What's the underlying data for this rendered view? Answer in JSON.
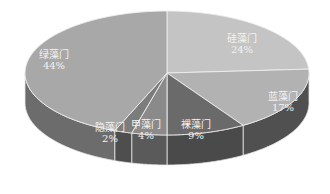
{
  "chart_data": {
    "type": "pie",
    "style": "3d",
    "title": "",
    "categories": [
      "硅藻门",
      "蓝藻门",
      "裸藻门",
      "甲藻门",
      "隐藻门",
      "绿藻门"
    ],
    "values": [
      24,
      17,
      9,
      4,
      2,
      44
    ],
    "value_labels": [
      "24%",
      "17%",
      "9%",
      "4%",
      "2%",
      "44%"
    ],
    "colors_top": [
      "#c4c4c4",
      "#b2b2b2",
      "#6a6a6a",
      "#8a8a8a",
      "#7c7c7c",
      "#a8a8a8"
    ],
    "colors_side": [
      "#8c8c8c",
      "#505050",
      "#4a4a4a",
      "#5a5a5a",
      "#4e4e4e",
      "#6c6c6c"
    ],
    "legend": "none",
    "start_angle_deg": -90,
    "direction": "clockwise"
  },
  "labels": [
    {
      "name": "硅藻门",
      "pct": "24%",
      "x": 242,
      "y": 42
    },
    {
      "name": "蓝藻门",
      "pct": "17%",
      "x": 283,
      "y": 100
    },
    {
      "name": "裸藻门",
      "pct": "9%",
      "x": 196,
      "y": 128
    },
    {
      "name": "甲藻门",
      "pct": "4%",
      "x": 146,
      "y": 128
    },
    {
      "name": "隐藻门",
      "pct": "2%",
      "x": 110,
      "y": 131
    },
    {
      "name": "绿藻门",
      "pct": "44%",
      "x": 54,
      "y": 58
    }
  ]
}
